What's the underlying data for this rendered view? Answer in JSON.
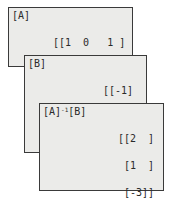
{
  "screens": [
    {
      "title": "[A]",
      "rows": [
        "[[1  0   1 ]",
        " [2  -2  -1]",
        " [3  0   0 ]]"
      ]
    },
    {
      "title": "[B]",
      "rows": [
        "[[-1]",
        " [5 ]",
        " [6 ]]"
      ]
    },
    {
      "title_parts": {
        "a": "[A]",
        "exp": "-1",
        "b": "[B]"
      },
      "rows": [
        "[[2  ]",
        " [1  ]",
        " [-3]]"
      ]
    }
  ]
}
